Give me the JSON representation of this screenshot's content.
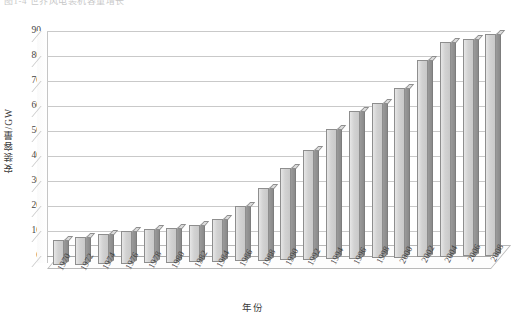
{
  "caption": "图1-4 世界风电装机容量增长",
  "chart_data": {
    "type": "bar",
    "title": "",
    "xlabel": "年份",
    "ylabel": "安装容量/GW",
    "ylim": [
      0,
      90
    ],
    "yticks": [
      0,
      10,
      20,
      30,
      40,
      50,
      60,
      70,
      80,
      90
    ],
    "grid": true,
    "legend": "none",
    "style": "3d-column",
    "categories": [
      "1970",
      "1972",
      "1974",
      "1976",
      "1978",
      "1980",
      "1982",
      "1984",
      "1986",
      "1988",
      "1990",
      "1992",
      "1994",
      "1996",
      "1998",
      "2000",
      "2002",
      "2004",
      "2006",
      "2008"
    ],
    "values": [
      10,
      11,
      12,
      13,
      13.5,
      14,
      15,
      17,
      22,
      29,
      37,
      44,
      52,
      59,
      62,
      68,
      79,
      86,
      87,
      89
    ],
    "units": "GW"
  },
  "axis": {
    "y_title": "安装容量/GW",
    "x_title": "年份"
  }
}
